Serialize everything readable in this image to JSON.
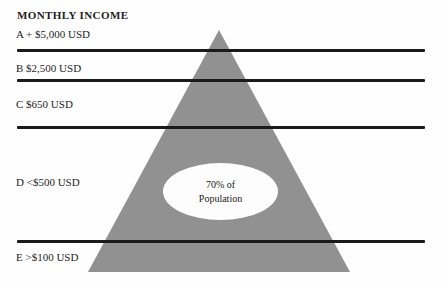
{
  "title": "MONTHLY INCOME",
  "levels": [
    {
      "id": "A",
      "label": "A + $5,000 USD"
    },
    {
      "id": "B",
      "label": "B $2,500 USD"
    },
    {
      "id": "C",
      "label": "C $650 USD"
    },
    {
      "id": "D",
      "label": "D <$500 USD"
    },
    {
      "id": "E",
      "label": "E >$100 USD"
    }
  ],
  "pyramid": {
    "fill_color": "#919191",
    "callout": {
      "line1": "70% of",
      "line2": "Population"
    }
  },
  "divider_color": "#1a1a1a",
  "background_color": "#fefefe"
}
